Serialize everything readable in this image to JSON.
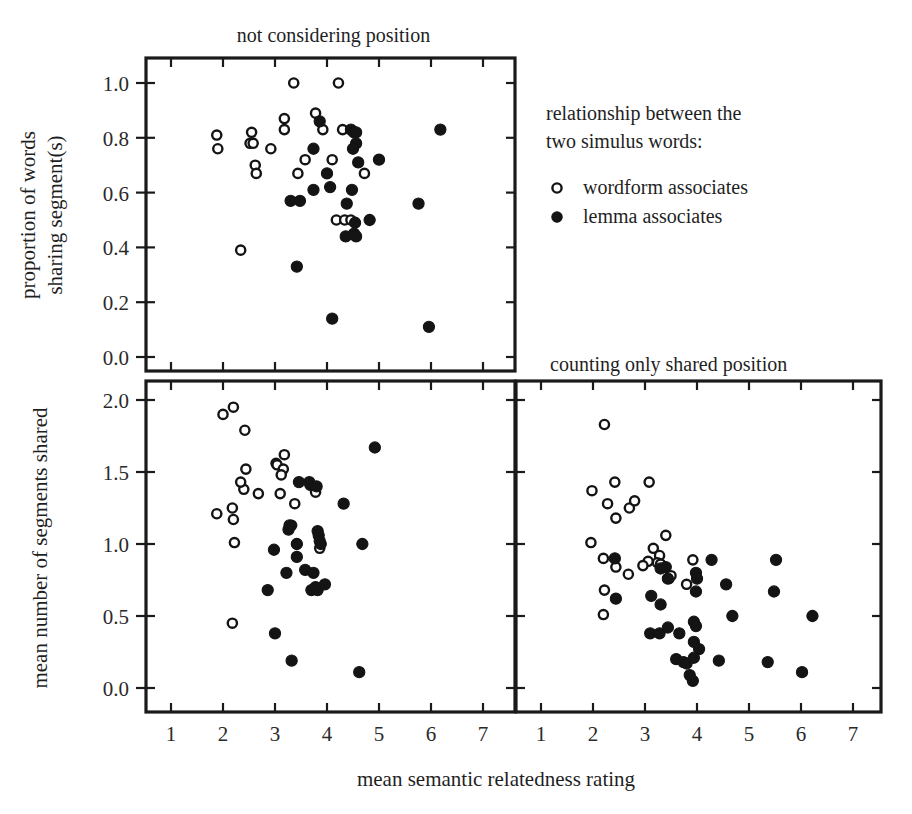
{
  "figure": {
    "x_axis_title": "mean semantic relatedness rating",
    "legend": {
      "heading_line1": "relationship between the",
      "heading_line2": "two simulus words:",
      "entries": [
        {
          "label": "wordform associates",
          "marker": "open-circle-icon",
          "color": "#ffffff"
        },
        {
          "label": "lemma associates",
          "marker": "filled-circle-icon",
          "color": "#141414"
        }
      ]
    },
    "y_axis_titles": {
      "top": [
        "proportion of words",
        "sharing segment(s)"
      ],
      "bottom": [
        "mean number of segments shared"
      ]
    },
    "xtick_labels": [
      "1",
      "2",
      "3",
      "4",
      "5",
      "6",
      "7"
    ],
    "ytick_labels_top": [
      "0.0",
      "0.2",
      "0.4",
      "0.6",
      "0.8",
      "1.0"
    ],
    "ytick_labels_bottom": [
      "0.0",
      "0.5",
      "1.0",
      "1.5",
      "2.0"
    ]
  },
  "chart_data": [
    {
      "id": "panel-top-left",
      "type": "scatter",
      "title": "not considering position",
      "xlabel": "mean semantic relatedness rating",
      "ylabel": "proportion of words sharing segment(s)",
      "xlim": [
        0.6,
        7.6
      ],
      "ylim": [
        -0.04,
        1.09
      ],
      "xticks": [
        1,
        2,
        3,
        4,
        5,
        6,
        7
      ],
      "yticks": [
        0.0,
        0.2,
        0.4,
        0.6,
        0.8,
        1.0
      ],
      "grid": false,
      "series": [
        {
          "name": "wordform associates",
          "marker": "open-circle",
          "points": [
            [
              1.88,
              0.81
            ],
            [
              1.9,
              0.76
            ],
            [
              2.34,
              0.39
            ],
            [
              2.52,
              0.78
            ],
            [
              2.55,
              0.82
            ],
            [
              2.58,
              0.78
            ],
            [
              2.62,
              0.7
            ],
            [
              2.64,
              0.67
            ],
            [
              2.92,
              0.76
            ],
            [
              3.18,
              0.87
            ],
            [
              3.18,
              0.83
            ],
            [
              3.36,
              1.0
            ],
            [
              3.44,
              0.67
            ],
            [
              3.58,
              0.72
            ],
            [
              3.78,
              0.89
            ],
            [
              3.92,
              0.83
            ],
            [
              4.1,
              0.72
            ],
            [
              4.18,
              0.5
            ],
            [
              4.34,
              0.5
            ],
            [
              4.46,
              0.5
            ],
            [
              4.22,
              1.0
            ],
            [
              4.3,
              0.83
            ],
            [
              4.72,
              0.67
            ]
          ]
        },
        {
          "name": "lemma associates",
          "marker": "filled-circle",
          "points": [
            [
              3.3,
              0.57
            ],
            [
              3.48,
              0.57
            ],
            [
              3.42,
              0.33
            ],
            [
              3.74,
              0.76
            ],
            [
              3.74,
              0.61
            ],
            [
              3.86,
              0.86
            ],
            [
              4.0,
              0.67
            ],
            [
              4.06,
              0.62
            ],
            [
              4.1,
              0.14
            ],
            [
              4.46,
              0.83
            ],
            [
              4.52,
              0.82
            ],
            [
              4.56,
              0.82
            ],
            [
              4.56,
              0.78
            ],
            [
              4.5,
              0.76
            ],
            [
              4.6,
              0.71
            ],
            [
              4.38,
              0.56
            ],
            [
              4.48,
              0.61
            ],
            [
              4.54,
              0.49
            ],
            [
              4.36,
              0.44
            ],
            [
              4.52,
              0.45
            ],
            [
              4.56,
              0.44
            ],
            [
              4.82,
              0.5
            ],
            [
              5.0,
              0.72
            ],
            [
              5.76,
              0.56
            ],
            [
              6.18,
              0.83
            ],
            [
              5.96,
              0.11
            ]
          ]
        }
      ]
    },
    {
      "id": "panel-bottom-left",
      "type": "scatter",
      "title": "",
      "xlabel": "mean semantic relatedness rating",
      "ylabel": "mean number of segments shared",
      "xlim": [
        0.6,
        7.6
      ],
      "ylim": [
        -0.08,
        2.12
      ],
      "xticks": [
        1,
        2,
        3,
        4,
        5,
        6,
        7
      ],
      "yticks": [
        0.0,
        0.5,
        1.0,
        1.5,
        2.0
      ],
      "grid": false,
      "series": [
        {
          "name": "wordform associates",
          "marker": "open-circle",
          "points": [
            [
              1.88,
              1.21
            ],
            [
              2.0,
              1.9
            ],
            [
              2.2,
              1.95
            ],
            [
              2.18,
              1.25
            ],
            [
              2.2,
              1.17
            ],
            [
              2.22,
              1.01
            ],
            [
              2.18,
              0.45
            ],
            [
              2.42,
              1.79
            ],
            [
              2.44,
              1.52
            ],
            [
              2.4,
              1.38
            ],
            [
              2.34,
              1.43
            ],
            [
              2.68,
              1.35
            ],
            [
              3.02,
              1.56
            ],
            [
              3.04,
              1.55
            ],
            [
              3.18,
              1.62
            ],
            [
              3.1,
              1.35
            ],
            [
              3.16,
              1.52
            ],
            [
              3.12,
              1.48
            ],
            [
              3.28,
              1.12
            ],
            [
              3.32,
              1.13
            ],
            [
              3.38,
              1.28
            ],
            [
              3.42,
              1.0
            ],
            [
              3.78,
              1.36
            ],
            [
              3.86,
              0.97
            ]
          ]
        },
        {
          "name": "lemma associates",
          "marker": "filled-circle",
          "points": [
            [
              2.98,
              0.96
            ],
            [
              3.0,
              0.38
            ],
            [
              2.86,
              0.68
            ],
            [
              3.22,
              0.8
            ],
            [
              3.26,
              1.1
            ],
            [
              3.28,
              1.13
            ],
            [
              3.32,
              0.19
            ],
            [
              3.46,
              1.43
            ],
            [
              3.42,
              0.91
            ],
            [
              3.42,
              1.0
            ],
            [
              3.58,
              0.82
            ],
            [
              3.68,
              1.41
            ],
            [
              3.66,
              1.43
            ],
            [
              3.8,
              1.4
            ],
            [
              3.82,
              1.09
            ],
            [
              3.84,
              1.06
            ],
            [
              3.86,
              1.02
            ],
            [
              3.88,
              1.0
            ],
            [
              3.74,
              0.8
            ],
            [
              3.7,
              0.68
            ],
            [
              3.78,
              0.7
            ],
            [
              3.82,
              0.68
            ],
            [
              3.96,
              0.72
            ],
            [
              4.32,
              1.28
            ],
            [
              4.68,
              1.0
            ],
            [
              4.92,
              1.67
            ],
            [
              4.62,
              0.11
            ]
          ]
        }
      ]
    },
    {
      "id": "panel-bottom-right",
      "type": "scatter",
      "title": "counting only shared position",
      "xlabel": "mean semantic relatedness rating",
      "ylabel": "mean number of segments shared",
      "xlim": [
        0.6,
        7.6
      ],
      "ylim": [
        -0.08,
        2.12
      ],
      "xticks": [
        1,
        2,
        3,
        4,
        5,
        6,
        7
      ],
      "yticks": [
        0.0,
        0.5,
        1.0,
        1.5,
        2.0
      ],
      "grid": false,
      "series": [
        {
          "name": "wordform associates",
          "marker": "open-circle",
          "points": [
            [
              2.22,
              1.83
            ],
            [
              1.98,
              1.37
            ],
            [
              2.42,
              1.43
            ],
            [
              2.28,
              1.28
            ],
            [
              2.7,
              1.25
            ],
            [
              2.8,
              1.3
            ],
            [
              3.08,
              1.43
            ],
            [
              2.44,
              1.18
            ],
            [
              1.96,
              1.01
            ],
            [
              2.2,
              0.9
            ],
            [
              2.44,
              0.84
            ],
            [
              2.68,
              0.79
            ],
            [
              2.22,
              0.68
            ],
            [
              3.16,
              0.97
            ],
            [
              3.28,
              0.92
            ],
            [
              3.4,
              1.06
            ],
            [
              3.06,
              0.88
            ],
            [
              3.24,
              0.87
            ],
            [
              3.3,
              0.86
            ],
            [
              2.96,
              0.85
            ],
            [
              3.46,
              0.76
            ],
            [
              3.92,
              0.89
            ],
            [
              3.5,
              0.78
            ],
            [
              3.8,
              0.72
            ],
            [
              2.2,
              0.51
            ]
          ]
        },
        {
          "name": "lemma associates",
          "marker": "filled-circle",
          "points": [
            [
              3.4,
              0.84
            ],
            [
              2.42,
              0.9
            ],
            [
              2.44,
              0.62
            ],
            [
              3.3,
              0.83
            ],
            [
              4.28,
              0.89
            ],
            [
              3.12,
              0.64
            ],
            [
              3.44,
              0.76
            ],
            [
              3.98,
              0.8
            ],
            [
              4.0,
              0.76
            ],
            [
              4.56,
              0.72
            ],
            [
              3.98,
              0.67
            ],
            [
              3.3,
              0.58
            ],
            [
              4.68,
              0.5
            ],
            [
              3.94,
              0.46
            ],
            [
              3.98,
              0.43
            ],
            [
              3.1,
              0.38
            ],
            [
              3.28,
              0.38
            ],
            [
              3.44,
              0.42
            ],
            [
              3.66,
              0.38
            ],
            [
              3.94,
              0.32
            ],
            [
              4.04,
              0.27
            ],
            [
              3.6,
              0.2
            ],
            [
              3.74,
              0.18
            ],
            [
              3.8,
              0.17
            ],
            [
              3.94,
              0.21
            ],
            [
              4.42,
              0.19
            ],
            [
              3.86,
              0.09
            ],
            [
              3.92,
              0.05
            ],
            [
              5.36,
              0.18
            ],
            [
              5.48,
              0.67
            ],
            [
              5.52,
              0.89
            ],
            [
              6.22,
              0.5
            ],
            [
              6.02,
              0.11
            ]
          ]
        }
      ]
    }
  ]
}
